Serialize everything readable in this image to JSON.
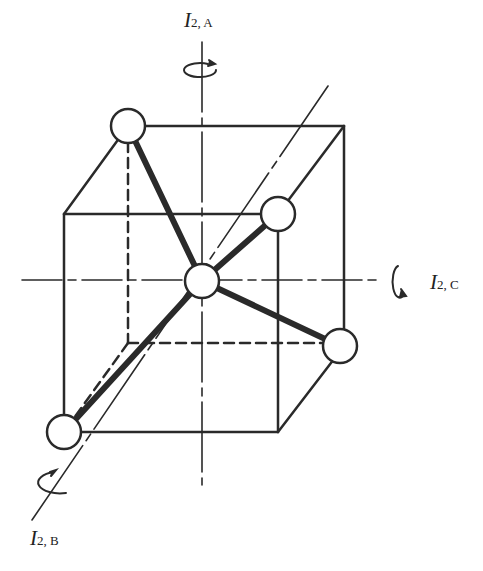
{
  "diagram": {
    "colors": {
      "line": "#2a2a2a",
      "background": "#ffffff",
      "atom_fill": "#ffffff"
    },
    "axes": [
      {
        "id": "A",
        "symbol": "I",
        "subscript": "2, A",
        "orientation": "vertical"
      },
      {
        "id": "B",
        "symbol": "I",
        "subscript": "2, B",
        "orientation": "diagonal"
      },
      {
        "id": "C",
        "symbol": "I",
        "subscript": "2, C",
        "orientation": "horizontal"
      }
    ],
    "atoms": {
      "central": 1,
      "outer": 4
    }
  }
}
